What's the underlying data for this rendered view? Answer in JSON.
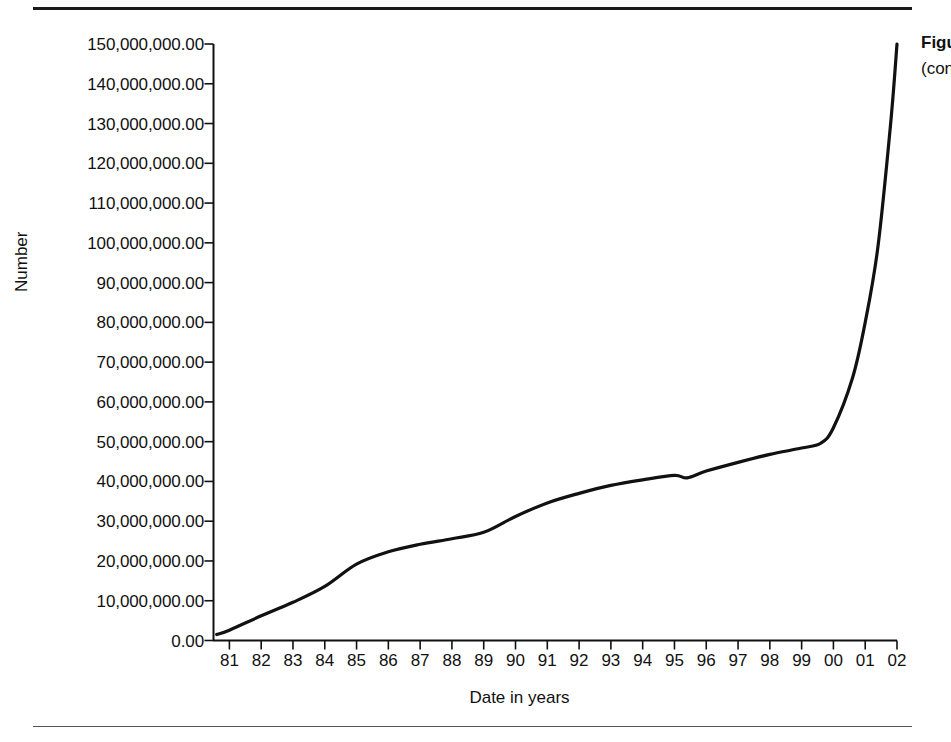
{
  "figure": {
    "rule_top": "horizontal-rule",
    "rule_bottom": "horizontal-rule"
  },
  "side_caption": {
    "line1": "Figure",
    "line2": "(conti"
  },
  "chart_data": {
    "type": "line",
    "title": "",
    "xlabel": "Date in years",
    "ylabel": "Number",
    "grid": false,
    "legend": "none",
    "line_color": "#111111",
    "xlim": [
      80.5,
      102.0
    ],
    "ylim": [
      0,
      150000000
    ],
    "x_tick_labels": [
      "81",
      "82",
      "83",
      "84",
      "85",
      "86",
      "87",
      "88",
      "89",
      "90",
      "91",
      "92",
      "93",
      "94",
      "95",
      "96",
      "97",
      "98",
      "99",
      "00",
      "01",
      "02"
    ],
    "y_tick_labels": [
      "0.00",
      "10,000,000.00",
      "20,000,000.00",
      "30,000,000.00",
      "40,000,000.00",
      "50,000,000.00",
      "60,000,000.00",
      "70,000,000.00",
      "80,000,000.00",
      "90,000,000.00",
      "100,000,000.00",
      "110,000,000.00",
      "120,000,000.00",
      "130,000,000.00",
      "140,000,000.00",
      "150,000,000.00"
    ],
    "y_tick_values": [
      0,
      10000000,
      20000000,
      30000000,
      40000000,
      50000000,
      60000000,
      70000000,
      80000000,
      90000000,
      100000000,
      110000000,
      120000000,
      130000000,
      140000000,
      150000000
    ],
    "x": [
      80.6,
      81,
      82,
      83,
      84,
      85,
      86,
      87,
      88,
      89,
      90,
      91,
      92,
      93,
      94,
      95,
      95.4,
      96,
      97,
      98,
      99,
      99.6,
      100,
      100.6,
      101,
      101.4,
      101.8,
      102
    ],
    "y": [
      1500000,
      2600000,
      6200000,
      9600000,
      13600000,
      19200000,
      22300000,
      24200000,
      25600000,
      27200000,
      31200000,
      34600000,
      37000000,
      39000000,
      40400000,
      41500000,
      40900000,
      42600000,
      44800000,
      46800000,
      48400000,
      49600000,
      53500000,
      66000000,
      80000000,
      99000000,
      130000000,
      150000000
    ],
    "series_name": "Number",
    "annotations": []
  }
}
